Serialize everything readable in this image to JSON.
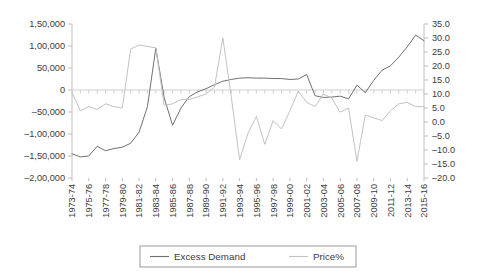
{
  "chart_data": {
    "type": "line",
    "title": "",
    "xlabel": "",
    "grid": false,
    "legend_position": "bottom",
    "x": [
      "1973-74",
      "1974-75",
      "1975-76",
      "1976-77",
      "1977-78",
      "1978-79",
      "1979-80",
      "1980-81",
      "1981-82",
      "1982-83",
      "1983-84",
      "1984-85",
      "1985-86",
      "1986-87",
      "1987-88",
      "1988-89",
      "1989-90",
      "1990-91",
      "1991-92",
      "1992-93",
      "1993-94",
      "1994-95",
      "1995-96",
      "1996-97",
      "1997-98",
      "1998-99",
      "1999-00",
      "2000-01",
      "2001-02",
      "2002-03",
      "2003-04",
      "2004-05",
      "2005-06",
      "2006-07",
      "2007-08",
      "2008-09",
      "2009-10",
      "2010-11",
      "2011-12",
      "2012-13",
      "2013-14",
      "2014-15",
      "2015-16"
    ],
    "x_tick_labels": [
      "1973-74",
      "1975-76",
      "1977-78",
      "1979-80",
      "1981-82",
      "1983-84",
      "1985-86",
      "1987-88",
      "1989-90",
      "1991-92",
      "1993-94",
      "1995-96",
      "1997-98",
      "1999-00",
      "2001-02",
      "2003-04",
      "2005-06",
      "2007-08",
      "2009-10",
      "2011-12",
      "2013-14",
      "2015-16"
    ],
    "left_axis": {
      "ylabel": "",
      "ylim": [
        -200000,
        150000
      ],
      "tick_values": [
        150000,
        100000,
        50000,
        0,
        -50000,
        -100000,
        -150000,
        -200000
      ],
      "tick_labels": [
        "1,50,000",
        "1,00,000",
        "50,000",
        "0",
        "‒50,000",
        "‒1,00,000",
        "‒1,50,000",
        "‒2,00,000"
      ]
    },
    "right_axis": {
      "ylabel": "",
      "ylim": [
        -20.0,
        35.0
      ],
      "tick_values": [
        35.0,
        30.0,
        25.0,
        20.0,
        15.0,
        10.0,
        5.0,
        0.0,
        -5.0,
        -10.0,
        -15.0,
        -20.0
      ],
      "tick_labels": [
        "35.0",
        "30.0",
        "25.0",
        "20.0",
        "15.0",
        "10.0",
        "5.0",
        "0.0",
        "‒5.0",
        "‒10.0",
        "‒15.0",
        "‒20.0"
      ]
    },
    "series": [
      {
        "name": "Excess Demand",
        "axis": "left",
        "color": "#70706f",
        "values": [
          -145000,
          -152000,
          -150000,
          -128000,
          -138000,
          -133000,
          -130000,
          -121000,
          -96000,
          -38000,
          95000,
          -18000,
          -80000,
          -41000,
          -15000,
          -4000,
          3000,
          12000,
          20000,
          24000,
          27000,
          28000,
          27000,
          27000,
          26000,
          26000,
          24000,
          25000,
          35000,
          -13000,
          -17000,
          -16000,
          -14000,
          -20000,
          11000,
          -6000,
          22000,
          45000,
          55000,
          75000,
          98000,
          125000,
          112000
        ]
      },
      {
        "name": "Price%",
        "axis": "right",
        "color": "#c2c2c1",
        "values": [
          10.5,
          4.0,
          5.5,
          4.5,
          6.5,
          5.5,
          5.0,
          26.0,
          27.5,
          27.0,
          26.5,
          6.0,
          6.5,
          8.0,
          8.0,
          9.0,
          10.0,
          12.5,
          30.0,
          9.0,
          -13.5,
          -4.0,
          2.0,
          -8.0,
          0.5,
          -2.5,
          4.0,
          11.0,
          7.0,
          5.5,
          10.0,
          8.5,
          3.5,
          5.0,
          -14.0,
          2.5,
          1.5,
          0.5,
          4.0,
          6.5,
          7.0,
          5.5,
          5.5
        ]
      }
    ],
    "legend": [
      {
        "label": "Excess Demand",
        "color": "#70706f"
      },
      {
        "label": "Price%",
        "color": "#c2c2c1"
      }
    ]
  },
  "colors": {
    "axis": "#bdbdbd",
    "text": "#3c3c3c",
    "zero_line": "#cfcfcf",
    "legend_border": "#9a9a9a",
    "background": "#ffffff"
  }
}
